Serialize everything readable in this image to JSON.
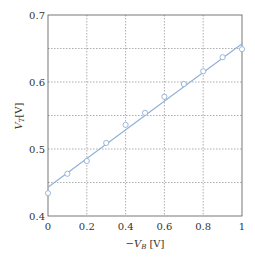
{
  "chart_data": {
    "type": "scatter",
    "title": "",
    "xlabel": "−V_B [V]",
    "ylabel": "V_T [V]",
    "xlim": [
      0,
      1
    ],
    "ylim": [
      0.4,
      0.7
    ],
    "grid": true,
    "x_ticks": [
      0,
      0.2,
      0.4,
      0.6,
      0.8,
      1
    ],
    "x_tick_labels": [
      "0",
      "0.2",
      "0.4",
      "0.6",
      "0.8",
      "1"
    ],
    "y_ticks": [
      0.4,
      0.45,
      0.5,
      0.55,
      0.6,
      0.65,
      0.7
    ],
    "y_tick_labels": [
      "0.4",
      "",
      "0.5",
      "",
      "0.6",
      "",
      "0.7"
    ],
    "series": [
      {
        "name": "measured",
        "type": "scatter",
        "marker": "open-circle",
        "color": "#8fb0d8",
        "x": [
          0,
          0.1,
          0.2,
          0.3,
          0.4,
          0.5,
          0.6,
          0.7,
          0.8,
          0.9,
          1.0
        ],
        "y": [
          0.434,
          0.463,
          0.482,
          0.509,
          0.536,
          0.554,
          0.578,
          0.597,
          0.616,
          0.637,
          0.649
        ]
      },
      {
        "name": "fit",
        "type": "line",
        "color": "#8fb0d8",
        "x": [
          0,
          1
        ],
        "y": [
          0.443,
          0.657
        ]
      }
    ]
  },
  "axes": {
    "xlabel_prefix": "−",
    "xlabel_var": "V",
    "xlabel_sub": "B",
    "xlabel_unit": " [V]",
    "ylabel_var": "V",
    "ylabel_sub": "T",
    "ylabel_unit": "[V]"
  }
}
